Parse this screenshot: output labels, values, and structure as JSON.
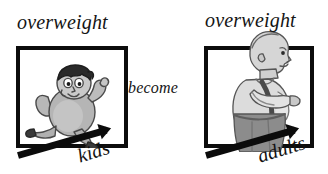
{
  "background_color": "#ffffff",
  "ink_color": "#0c0c0c",
  "figure_tones": {
    "kid_body": "#b5b5b5",
    "kid_hair": "#2a2a2a",
    "adult_shirt": "#dcdcdc",
    "adult_pants": "#8c8c8c",
    "adult_skin": "#d2d2d2",
    "outline": "#4a4a4a"
  },
  "panels": {
    "left": {
      "top_caption": "overweight",
      "bottom_caption": "kids",
      "figure_name": "overweight-child-running"
    },
    "right": {
      "top_caption": "overweight",
      "bottom_caption": "adults",
      "figure_name": "overweight-adult-man-profile"
    }
  },
  "connector": {
    "label": "become"
  },
  "icons": {
    "arrow_left": "arrow-right-icon",
    "arrow_right": "arrow-right-icon"
  }
}
